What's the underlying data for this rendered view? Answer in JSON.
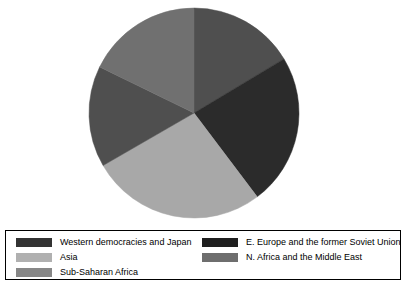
{
  "chart_data": {
    "type": "pie",
    "title": "",
    "subtitle": "",
    "xlabel": "",
    "ylabel": "",
    "legend_position": "bottom",
    "grid": false,
    "start_angle_deg": 0,
    "direction": "clockwise",
    "categories": [
      "Western democracies and Japan",
      "E. Europe and the former Soviet Union",
      "Asia",
      "Sub-Saharan Africa",
      "N. Africa and the Middle East"
    ],
    "values": [
      16.4,
      23.3,
      27.0,
      15.6,
      17.7
    ],
    "slices": [
      {
        "label": "Western democracies and Japan",
        "value": 16.4,
        "start_deg": 0,
        "end_deg": 59,
        "color": "#4f4f4f"
      },
      {
        "label": "E. Europe and the former Soviet Union",
        "value": 23.3,
        "start_deg": 59,
        "end_deg": 143,
        "color": "#2b2b2b"
      },
      {
        "label": "Asia",
        "value": 27.0,
        "start_deg": 143,
        "end_deg": 240,
        "color": "#a8a8a8"
      },
      {
        "label": "Sub-Saharan Africa",
        "value": 15.6,
        "start_deg": 240,
        "end_deg": 296,
        "color": "#4f4f4f"
      },
      {
        "label": "N. Africa and the Middle East",
        "value": 17.7,
        "start_deg": 296,
        "end_deg": 360,
        "color": "#707070"
      }
    ]
  },
  "pie": {
    "center_x": 194,
    "center_y": 113,
    "radius": 105
  },
  "legend": {
    "left_column": [
      {
        "label": "Western democracies and Japan",
        "color": "#333333"
      },
      {
        "label": "Asia",
        "color": "#b0b0b0"
      },
      {
        "label": "Sub-Saharan Africa",
        "color": "#878787"
      }
    ],
    "right_column": [
      {
        "label": "E. Europe and the former Soviet Union",
        "color": "#1f1f1f"
      },
      {
        "label": "N. Africa and the Middle East",
        "color": "#6e6e6e"
      }
    ]
  },
  "colors": {
    "background": "#ffffff",
    "border": "#000000",
    "text": "#000000",
    "western_democracies": "#333333",
    "eastern_europe": "#1f1f1f",
    "asia": "#b0b0b0",
    "subsaharan_africa": "#878787",
    "north_africa_middle_east": "#6e6e6e"
  }
}
